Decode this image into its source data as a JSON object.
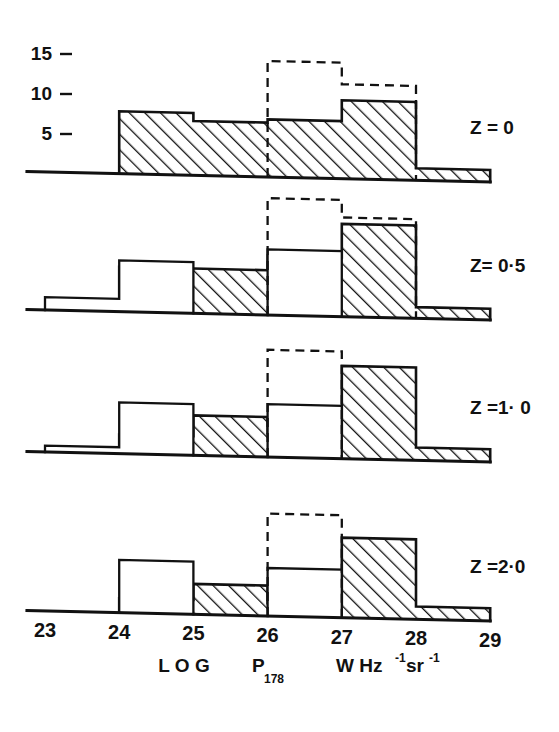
{
  "figure": {
    "background": "#ffffff",
    "ink": "#111111",
    "y_axis": {
      "ticks": [
        "15",
        "10",
        "5"
      ],
      "tick_values": [
        15,
        10,
        5
      ],
      "max": 16
    },
    "x_axis": {
      "ticks": [
        "23",
        "24",
        "25",
        "26",
        "27",
        "28",
        "29"
      ],
      "tick_values": [
        23,
        24,
        25,
        26,
        27,
        28,
        29
      ],
      "title_main": "L O G",
      "title_symbol": "P",
      "title_subscript": "178",
      "title_units_w": "W Hz",
      "title_units_sup1": "-1",
      "title_units_sr": "sr",
      "title_units_sup2": "-1"
    }
  },
  "chart_data": {
    "type": "bar",
    "title": "",
    "xlabel": "LOG P178  W Hz^-1 sr^-1",
    "ylabel": "",
    "xlim": [
      23,
      29
    ],
    "ylim": [
      0,
      16
    ],
    "grid": false,
    "legend": "none",
    "bin_edges": [
      23,
      24,
      25,
      26,
      27,
      28,
      29
    ],
    "categories": [
      "23-24",
      "24-25",
      "25-26",
      "26-27",
      "27-28",
      "28-29"
    ],
    "panels": [
      {
        "label": "Z = 0",
        "z": 0,
        "series": [
          {
            "name": "observed",
            "style": "hatched",
            "values": [
              0,
              7.8,
              6.8,
              7.2,
              9.8,
              1.5
            ]
          },
          {
            "name": "model",
            "style": "outline",
            "values": [
              0,
              0,
              0,
              0,
              0,
              0
            ]
          },
          {
            "name": "predicted",
            "style": "dashed",
            "values": [
              0,
              0,
              0,
              14.5,
              11.8,
              0
            ]
          }
        ]
      },
      {
        "label": "Z= 0·5",
        "z": 0.5,
        "series": [
          {
            "name": "observed",
            "style": "hatched",
            "values": [
              0,
              5.6,
              5.6,
              7.4,
              11.6,
              1.4
            ]
          },
          {
            "name": "model",
            "style": "outline",
            "values": [
              1.6,
              6.4,
              0,
              8.2,
              0,
              0
            ]
          },
          {
            "name": "predicted",
            "style": "dashed",
            "values": [
              0,
              0,
              0,
              14.6,
              12.4,
              0
            ]
          }
        ]
      },
      {
        "label": "Z =1· 0",
        "z": 1.0,
        "series": [
          {
            "name": "observed",
            "style": "hatched",
            "values": [
              0,
              2.4,
              5.0,
              3.0,
              11.6,
              1.6
            ]
          },
          {
            "name": "model",
            "style": "outline",
            "values": [
              0.8,
              6.4,
              0,
              6.6,
              0,
              0
            ]
          },
          {
            "name": "predicted",
            "style": "dashed",
            "values": [
              0,
              0,
              0,
              13.4,
              0,
              0
            ]
          }
        ]
      },
      {
        "label": "Z =2·0",
        "z": 2.0,
        "series": [
          {
            "name": "observed",
            "style": "hatched",
            "values": [
              0,
              1.8,
              3.8,
              1.6,
              10.0,
              1.6
            ]
          },
          {
            "name": "model",
            "style": "outline",
            "values": [
              0,
              6.6,
              0,
              6.0,
              0,
              0
            ]
          },
          {
            "name": "predicted",
            "style": "dashed",
            "values": [
              0,
              0,
              0,
              12.8,
              0,
              0
            ]
          }
        ]
      }
    ]
  }
}
